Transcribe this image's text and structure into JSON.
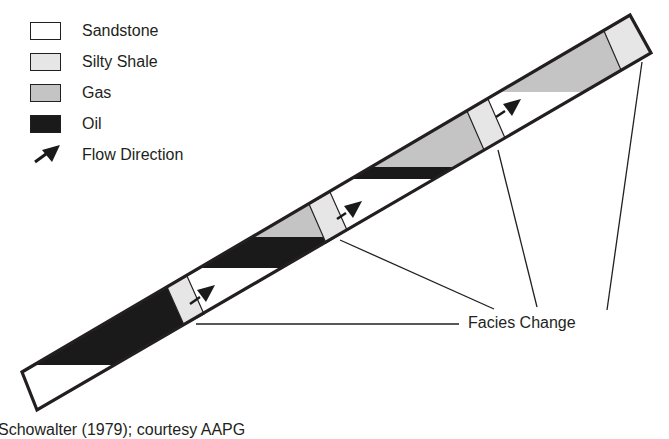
{
  "legend": {
    "items": [
      {
        "label": "Sandstone",
        "fill": "#ffffff"
      },
      {
        "label": "Silty Shale",
        "fill": "#e6e6e6"
      },
      {
        "label": "Gas",
        "fill": "#c4c4c4"
      },
      {
        "label": "Oil",
        "fill": "#1a1a1a"
      },
      {
        "label": "Flow Direction",
        "fill": "#1a1a1a"
      }
    ]
  },
  "diagram": {
    "annotation": "Facies Change",
    "segments": [
      {
        "id": 1,
        "contents": [
          "Oil",
          "Sandstone (water)"
        ],
        "oil_water_contact_y": 365
      },
      {
        "id": 2,
        "contents": [
          "Gas",
          "Oil",
          "Sandstone (water)"
        ],
        "gas_oil_contact_y": 237,
        "oil_water_contact_y": 268
      },
      {
        "id": 3,
        "contents": [
          "Gas",
          "Oil",
          "Sandstone (water)"
        ],
        "gas_oil_contact_y": 167,
        "oil_water_contact_y": 178
      },
      {
        "id": 4,
        "contents": [
          "Gas",
          "Sandstone (water)"
        ],
        "gas_water_contact_y": 92
      }
    ],
    "colors": {
      "outline": "#231f20",
      "shale": "#e6e6e6",
      "gas": "#c4c4c4",
      "oil": "#1a1a1a",
      "sandstone": "#ffffff"
    }
  },
  "credit": "Schowalter (1979); courtesy AAPG"
}
